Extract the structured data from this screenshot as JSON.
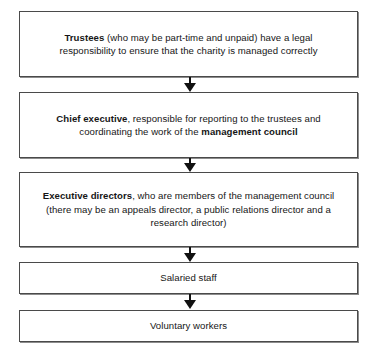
{
  "diagram": {
    "type": "flowchart",
    "orientation": "top-to-bottom",
    "colors": {
      "background": "#ffffff",
      "box_border": "#4a4a4a",
      "box_fill": "#ffffff",
      "text": "#161616",
      "arrow": "#111111",
      "shadow": "#8c8c8c"
    },
    "nodes": [
      {
        "id": "trustees",
        "segments": [
          {
            "text": "Trustees",
            "bold": true
          },
          {
            "text": " (who may be part-time and unpaid) have a legal responsibility to ensure that the charity is managed correctly",
            "bold": false
          }
        ],
        "plain_text": "Trustees (who may be part-time and unpaid) have a legal responsibility to ensure that the charity is managed correctly"
      },
      {
        "id": "chief-executive",
        "segments": [
          {
            "text": "Chief executive",
            "bold": true
          },
          {
            "text": ", responsible for reporting to the trustees and coordinating the work of the ",
            "bold": false
          },
          {
            "text": "management council",
            "bold": true
          }
        ],
        "plain_text": "Chief executive, responsible for reporting to the trustees and coordinating the work of the management council"
      },
      {
        "id": "executive-directors",
        "segments": [
          {
            "text": "Executive directors",
            "bold": true
          },
          {
            "text": ", who are members of the management council (there may be an appeals director, a public relations director and a research director)",
            "bold": false
          }
        ],
        "plain_text": "Executive directors, who are members of the management council (there may be an appeals director, a public relations director and a research director)"
      },
      {
        "id": "salaried-staff",
        "segments": [
          {
            "text": "Salaried staff",
            "bold": false
          }
        ],
        "plain_text": "Salaried staff"
      },
      {
        "id": "voluntary-workers",
        "segments": [
          {
            "text": "Voluntary workers",
            "bold": false
          }
        ],
        "plain_text": "Voluntary workers"
      }
    ],
    "connectors": [
      {
        "id": "arrow-trustees-to-chief-executive",
        "from": "trustees",
        "to": "chief-executive",
        "style": "solid-down-arrow"
      },
      {
        "id": "arrow-chief-executive-to-executive-directors",
        "from": "chief-executive",
        "to": "executive-directors",
        "style": "solid-down-arrow"
      },
      {
        "id": "arrow-executive-directors-to-salaried-staff",
        "from": "executive-directors",
        "to": "salaried-staff",
        "style": "solid-down-arrow"
      },
      {
        "id": "arrow-salaried-staff-to-voluntary-workers",
        "from": "salaried-staff",
        "to": "voluntary-workers",
        "style": "solid-down-arrow"
      }
    ]
  }
}
